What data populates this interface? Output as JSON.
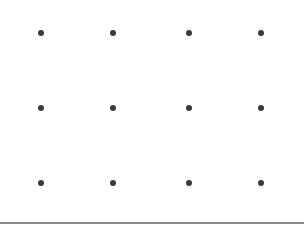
{
  "grid": {
    "rows": 3,
    "cols": 4,
    "col_x": [
      41,
      113,
      189,
      261
    ],
    "row_y": [
      33,
      108,
      183
    ],
    "dot_color": "#3a3a3a",
    "dot_diameter": 6
  },
  "baseline": {
    "y": 222,
    "color": "#8a8a8a"
  }
}
